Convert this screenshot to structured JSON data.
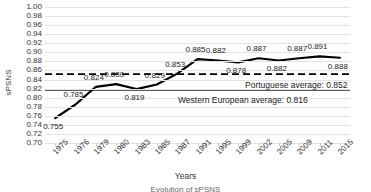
{
  "chart_data": {
    "type": "line",
    "title": "",
    "xlabel": "Years",
    "ylabel": "sPSNS",
    "ylim": [
      0.7,
      1.0
    ],
    "ytick_step": 0.02,
    "grid": true,
    "legend": "none",
    "categories": [
      "1975",
      "1976",
      "1979",
      "1980",
      "1983",
      "1985",
      "1987",
      "1991",
      "1995",
      "1999",
      "2002",
      "2005",
      "2009",
      "2011",
      "2015"
    ],
    "series": [
      {
        "name": "sPSNS",
        "values": [
          0.755,
          0.785,
          0.824,
          0.83,
          0.819,
          0.829,
          0.853,
          0.885,
          0.882,
          0.878,
          0.887,
          0.882,
          0.887,
          0.891,
          0.888
        ],
        "labels": [
          "0.755",
          "0.785",
          "0.824",
          "0.830",
          "0.819",
          "0.829",
          "0.853",
          "0.885",
          "0.882",
          "0.878",
          "0.887",
          "0.882",
          "0.887",
          "0.891",
          "0.888"
        ],
        "color": "#000000"
      }
    ],
    "yticks": [
      "1.00",
      "0.98",
      "0.96",
      "0.94",
      "0.92",
      "0.90",
      "0.88",
      "0.86",
      "0.84",
      "0.82",
      "0.80",
      "0.78",
      "0.76",
      "0.74",
      "0.72",
      "0.70"
    ],
    "reference_lines": [
      {
        "name": "portuguese-average",
        "label": "Portuguese average: 0.852",
        "value": 0.852,
        "style": "dashed",
        "color": "#000000"
      },
      {
        "name": "western-european-average",
        "label": "Western European average: 0.816",
        "value": 0.816,
        "style": "solid",
        "color": "#595959"
      }
    ]
  },
  "caption": {
    "text": "Evolution of sPSNS"
  }
}
